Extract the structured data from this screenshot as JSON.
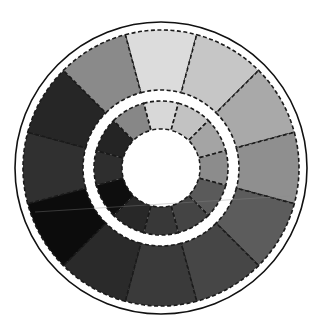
{
  "figure": {
    "type": "grayscale-color-wheel",
    "center": [
      161,
      168
    ],
    "outer_circle_radius": 146,
    "outer_ring": {
      "inner_radius": 78,
      "outer_radius": 138
    },
    "inner_ring": {
      "inner_radius": 39,
      "outer_radius": 67
    },
    "segment_count": 12,
    "segment_angle_deg": 30,
    "first_segment_center_deg": 0,
    "outer_ring_colors": [
      "#dcdcdc",
      "#c6c6c6",
      "#a9a9a9",
      "#8f8f8f",
      "#5c5c5c",
      "#464646",
      "#3a3a3a",
      "#2a2a2a",
      "#0c0c0c",
      "#303030",
      "#262626",
      "#8a8a8a"
    ],
    "inner_ring_colors": [
      "#d8d8d8",
      "#c2c2c2",
      "#a4a4a4",
      "#8c8c8c",
      "#5a5a5a",
      "#444444",
      "#383838",
      "#282828",
      "#0e0e0e",
      "#2e2e2e",
      "#242424",
      "#878787"
    ],
    "outline_color": "#111111",
    "background": "#ffffff"
  }
}
